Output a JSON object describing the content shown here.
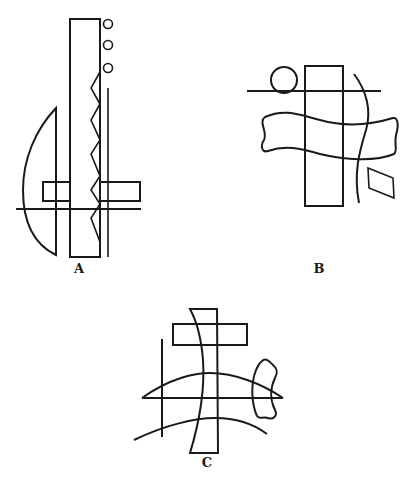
{
  "figure": {
    "ink_color": "#1a1a1a",
    "background": "#ffffff",
    "panels": [
      {
        "id": "A",
        "label": "A",
        "label_pos": [
          79,
          262
        ],
        "elements": [
          "tall rectangle",
          "three small circles",
          "zigzag edge",
          "vertical line",
          "crescent",
          "two horizontal bars",
          "horizontal line"
        ]
      },
      {
        "id": "B",
        "label": "B",
        "label_pos": [
          319,
          262
        ],
        "elements": [
          "tall rectangle",
          "circle",
          "horizontal line",
          "wavy band",
          "curved arc",
          "parallelogram"
        ]
      },
      {
        "id": "C",
        "label": "C",
        "label_pos": [
          207,
          455
        ],
        "elements": [
          "bent tall rectangle",
          "horizontal bar",
          "vertical line",
          "upper arc",
          "horizontal line",
          "lower arc",
          "bone shape"
        ]
      }
    ]
  }
}
